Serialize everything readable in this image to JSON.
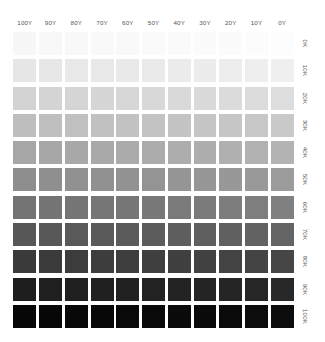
{
  "chart_data": {
    "type": "heatmap",
    "title": "",
    "subtitle": "",
    "xlabel": "",
    "ylabel": "",
    "grid": false,
    "legend": "none",
    "x_axis_position": "top",
    "y_axis_position": "right",
    "categories": [
      "100Y",
      "90Y",
      "80Y",
      "70Y",
      "60Y",
      "50Y",
      "40Y",
      "30Y",
      "20Y",
      "10Y",
      "0Y"
    ],
    "x": [
      100,
      90,
      80,
      70,
      60,
      50,
      40,
      30,
      20,
      10,
      0
    ],
    "row_categories": [
      "0K",
      "10K",
      "20K",
      "30K",
      "40K",
      "50K",
      "60K",
      "70K",
      "80K",
      "90K",
      "100K"
    ],
    "y": [
      0,
      10,
      20,
      30,
      40,
      50,
      60,
      70,
      80,
      90,
      100
    ],
    "xlim": [
      100,
      0
    ],
    "ylim": [
      0,
      100
    ],
    "values": [
      [
        0,
        0,
        0,
        0,
        0,
        0,
        0,
        0,
        0,
        0,
        0
      ],
      [
        10,
        10,
        10,
        10,
        10,
        10,
        10,
        10,
        10,
        10,
        10
      ],
      [
        20,
        20,
        20,
        20,
        20,
        20,
        20,
        20,
        20,
        20,
        20
      ],
      [
        30,
        30,
        30,
        30,
        30,
        30,
        30,
        30,
        30,
        30,
        30
      ],
      [
        40,
        40,
        40,
        40,
        40,
        40,
        40,
        40,
        40,
        40,
        40
      ],
      [
        50,
        50,
        50,
        50,
        50,
        50,
        50,
        50,
        50,
        50,
        50
      ],
      [
        60,
        60,
        60,
        60,
        60,
        60,
        60,
        60,
        60,
        60,
        60
      ],
      [
        70,
        70,
        70,
        70,
        70,
        70,
        70,
        70,
        70,
        70,
        70
      ],
      [
        80,
        80,
        80,
        80,
        80,
        80,
        80,
        80,
        80,
        80,
        80
      ],
      [
        90,
        90,
        90,
        90,
        90,
        90,
        90,
        90,
        90,
        90,
        90
      ],
      [
        100,
        100,
        100,
        100,
        100,
        100,
        100,
        100,
        100,
        100,
        100
      ]
    ],
    "cell_colors": [
      [
        "#f7f7f7",
        "#f8f8f8",
        "#f8f8f8",
        "#f9f9f9",
        "#f9f9f9",
        "#fafafa",
        "#fafafa",
        "#fbfbfb",
        "#fbfbfb",
        "#fcfcfc",
        "#fdfdfd"
      ],
      [
        "#e6e6e6",
        "#e7e7e7",
        "#e8e8e8",
        "#e8e8e8",
        "#e9e9e9",
        "#eaeaea",
        "#ebebeb",
        "#ececec",
        "#ededed",
        "#eeeeee",
        "#efefef"
      ],
      [
        "#d3d3d3",
        "#d4d4d4",
        "#d5d5d5",
        "#d6d6d6",
        "#d7d7d7",
        "#d8d8d8",
        "#d9d9d9",
        "#dadada",
        "#dbdbdb",
        "#dcdcdc",
        "#dddddd"
      ],
      [
        "#bebebe",
        "#bfbfbf",
        "#c0c0c0",
        "#c1c1c1",
        "#c2c2c2",
        "#c3c3c3",
        "#c4c4c4",
        "#c5c5c5",
        "#c6c6c6",
        "#c7c7c7",
        "#c9c9c9"
      ],
      [
        "#a6a6a6",
        "#a7a7a7",
        "#a8a8a8",
        "#a9a9a9",
        "#ababab",
        "#acacac",
        "#adadad",
        "#aeaeae",
        "#b0b0b0",
        "#b1b1b1",
        "#b3b3b3"
      ],
      [
        "#8e8e8e",
        "#8f8f8f",
        "#909090",
        "#919191",
        "#929292",
        "#949494",
        "#959595",
        "#969696",
        "#989898",
        "#999999",
        "#9b9b9b"
      ],
      [
        "#737373",
        "#747474",
        "#757575",
        "#767676",
        "#777777",
        "#787878",
        "#7a7a7a",
        "#7b7b7b",
        "#7d7d7d",
        "#7e7e7e",
        "#808080"
      ],
      [
        "#575757",
        "#585858",
        "#595959",
        "#5a5a5a",
        "#5b5b5b",
        "#5c5c5c",
        "#5e5e5e",
        "#5f5f5f",
        "#606060",
        "#626262",
        "#646464"
      ],
      [
        "#3a3a3a",
        "#3b3b3b",
        "#3c3c3c",
        "#3d3d3d",
        "#3e3e3e",
        "#3f3f3f",
        "#404040",
        "#414141",
        "#434343",
        "#444444",
        "#464646"
      ],
      [
        "#1e1e1e",
        "#1f1f1f",
        "#1f1f1f",
        "#202020",
        "#212121",
        "#222222",
        "#232323",
        "#242424",
        "#252525",
        "#262626",
        "#282828"
      ],
      [
        "#070707",
        "#070707",
        "#080808",
        "#080808",
        "#090909",
        "#090909",
        "#0a0a0a",
        "#0a0a0a",
        "#0b0b0b",
        "#0c0c0c",
        "#0d0d0d"
      ]
    ]
  },
  "axes": {
    "column_labels": [
      "100Y",
      "90Y",
      "80Y",
      "70Y",
      "60Y",
      "50Y",
      "40Y",
      "30Y",
      "20Y",
      "10Y",
      "0Y"
    ],
    "row_labels": [
      "0K",
      "10K",
      "20K",
      "30K",
      "40K",
      "50K",
      "60K",
      "70K",
      "80K",
      "90K",
      "100K"
    ]
  },
  "style": {
    "background": "#ffffff",
    "label_color": "#555555"
  }
}
